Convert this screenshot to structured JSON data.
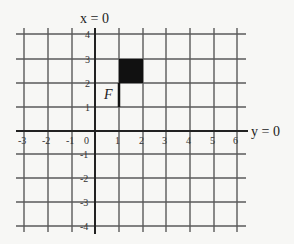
{
  "diagram": {
    "axes": {
      "vertical_axis_label": "x = 0",
      "horizontal_axis_label": "y = 0"
    },
    "x_ticks": [
      "-3",
      "-2",
      "-1",
      "0",
      "1",
      "2",
      "3",
      "4",
      "5",
      "6"
    ],
    "y_ticks": [
      "4",
      "3",
      "2",
      "1",
      "-1",
      "-2",
      "-3",
      "-4"
    ],
    "figure": {
      "label": "F",
      "filled_square": {
        "x0": 1,
        "y0": 2,
        "x1": 2,
        "y1": 3
      },
      "stem": {
        "x": 1,
        "y0": 1,
        "y1": 2
      },
      "fill_color": "#111111"
    },
    "grid_range": {
      "x": [
        -3,
        6
      ],
      "y": [
        -4,
        4
      ]
    }
  }
}
